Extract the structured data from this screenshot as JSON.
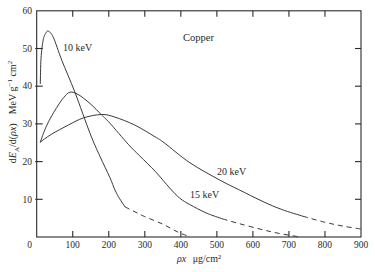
{
  "chart_data": {
    "type": "line",
    "title": "Copper",
    "xlabel": "ρx μg/cm²",
    "ylabel": "dE_A/d(ρx)   MeV g⁻¹ cm²",
    "xlim": [
      0,
      900
    ],
    "ylim": [
      0,
      60
    ],
    "xticks": [
      0,
      100,
      200,
      300,
      400,
      500,
      600,
      700,
      800,
      900
    ],
    "yticks": [
      10,
      20,
      30,
      40,
      50,
      60
    ],
    "xtick_labels": [
      "0",
      "100",
      "200",
      "300",
      "400",
      "500",
      "600",
      "700",
      "800",
      "900"
    ],
    "ytick_labels": [
      "10",
      "20",
      "30",
      "40",
      "50",
      "60"
    ],
    "grid": false,
    "legend": "inline curve labels",
    "series": [
      {
        "name": "10 keV",
        "solid": [
          [
            10,
            40.7
          ],
          [
            12,
            47.4
          ],
          [
            18,
            52.3
          ],
          [
            25,
            54.0
          ],
          [
            32,
            54.6
          ],
          [
            46,
            53.0
          ],
          [
            70,
            46.8
          ],
          [
            106,
            38.4
          ],
          [
            148,
            27.5
          ],
          [
            175,
            21.5
          ],
          [
            203,
            15.8
          ],
          [
            217,
            12.5
          ],
          [
            230,
            10.2
          ],
          [
            245,
            8.0
          ]
        ],
        "dashed": [
          [
            245,
            8.0
          ],
          [
            270,
            6.8
          ],
          [
            300,
            5.4
          ],
          [
            350,
            3.4
          ],
          [
            390,
            1.4
          ],
          [
            425,
            0.05
          ]
        ]
      },
      {
        "name": "15 keV",
        "solid": [
          [
            10,
            25.2
          ],
          [
            25,
            29.0
          ],
          [
            42,
            32.2
          ],
          [
            60,
            35.0
          ],
          [
            75,
            37.0
          ],
          [
            92,
            38.4
          ],
          [
            115,
            37.8
          ],
          [
            148,
            35.4
          ],
          [
            180,
            32.4
          ],
          [
            203,
            30.2
          ],
          [
            254,
            24.6
          ],
          [
            286,
            21.5
          ],
          [
            330,
            17.3
          ],
          [
            369,
            13.0
          ],
          [
            397,
            10.3
          ],
          [
            425,
            8.6
          ],
          [
            470,
            6.4
          ],
          [
            516,
            4.8
          ]
        ],
        "dashed": [
          [
            516,
            4.8
          ],
          [
            560,
            3.6
          ],
          [
            620,
            2.1
          ],
          [
            670,
            1.0
          ],
          [
            725,
            0.1
          ]
        ]
      },
      {
        "name": "20 keV",
        "solid": [
          [
            10,
            25.2
          ],
          [
            40,
            27.2
          ],
          [
            88,
            29.7
          ],
          [
            130,
            31.6
          ],
          [
            180,
            32.5
          ],
          [
            217,
            31.8
          ],
          [
            272,
            29.7
          ],
          [
            328,
            26.6
          ],
          [
            355,
            24.9
          ],
          [
            425,
            19.7
          ],
          [
            508,
            15.1
          ],
          [
            560,
            12.6
          ],
          [
            628,
            9.4
          ],
          [
            680,
            7.3
          ],
          [
            739,
            5.5
          ]
        ],
        "dashed": [
          [
            739,
            5.5
          ],
          [
            800,
            3.9
          ],
          [
            850,
            2.9
          ],
          [
            900,
            2.1
          ]
        ]
      }
    ]
  },
  "display": {
    "xlabel": {
      "symbol": "ρx",
      "units": "μg/cm²"
    },
    "ylabel": {
      "d": "d",
      "E": "E",
      "sub": "A",
      "per": "/d(",
      "symbol": "ρx",
      "close": ")",
      "units": "MeV g",
      "exp": "−1",
      "cm": " cm",
      "exp2": "2"
    },
    "colors": {
      "line": "#2e2e2e",
      "frame": "#2b2b2b",
      "background": "#ffffff"
    }
  }
}
